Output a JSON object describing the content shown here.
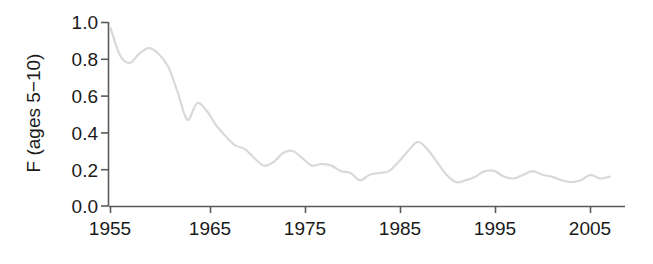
{
  "chart_data": {
    "type": "line",
    "title": "",
    "subtitle": "",
    "xlabel": "",
    "ylabel": "F (ages 5−10)",
    "xlim": [
      1955,
      2008
    ],
    "ylim": [
      0.0,
      1.0
    ],
    "grid": false,
    "legend": null,
    "line_color": "#d9d9d9",
    "axis_color": "#5a5a5a",
    "x_ticks": [
      1955,
      1965,
      1975,
      1985,
      1995,
      2005
    ],
    "x_tick_labels": [
      "1955",
      "1965",
      "1975",
      "1985",
      "1995",
      "2005"
    ],
    "y_ticks": [
      0.0,
      0.2,
      0.4,
      0.6,
      0.8,
      1.0
    ],
    "y_tick_labels": [
      "0.0",
      "0.2",
      "0.4",
      "0.6",
      "0.8",
      "1.0"
    ],
    "series": [
      {
        "name": "F (ages 5-10)",
        "x": [
          1955,
          1956,
          1957,
          1958,
          1959,
          1960,
          1961,
          1962,
          1963,
          1964,
          1965,
          1966,
          1967,
          1968,
          1969,
          1970,
          1971,
          1972,
          1973,
          1974,
          1975,
          1976,
          1977,
          1978,
          1979,
          1980,
          1981,
          1982,
          1983,
          1984,
          1985,
          1986,
          1987,
          1988,
          1989,
          1990,
          1991,
          1992,
          1993,
          1994,
          1995,
          1996,
          1997,
          1998,
          1999,
          2000,
          2001,
          2002,
          2003,
          2004,
          2005,
          2006,
          2007
        ],
        "values": [
          0.97,
          0.82,
          0.78,
          0.83,
          0.86,
          0.83,
          0.76,
          0.62,
          0.47,
          0.56,
          0.52,
          0.44,
          0.38,
          0.33,
          0.31,
          0.26,
          0.22,
          0.24,
          0.29,
          0.3,
          0.26,
          0.22,
          0.23,
          0.22,
          0.19,
          0.18,
          0.14,
          0.17,
          0.18,
          0.19,
          0.24,
          0.3,
          0.35,
          0.31,
          0.24,
          0.17,
          0.13,
          0.14,
          0.16,
          0.19,
          0.19,
          0.16,
          0.15,
          0.17,
          0.19,
          0.17,
          0.16,
          0.14,
          0.13,
          0.14,
          0.17,
          0.15,
          0.16
        ]
      }
    ],
    "extra_points": {
      "note": "values digitized from pixel positions; axis baseline y=0.0"
    }
  },
  "axis": {
    "y_title": "F (ages 5−10)"
  }
}
